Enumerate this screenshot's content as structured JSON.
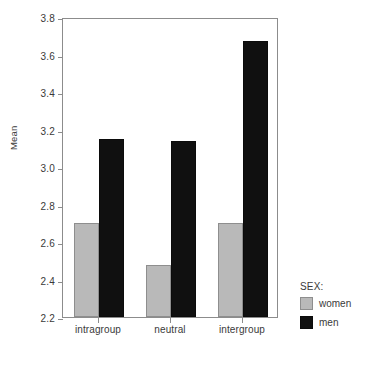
{
  "chart_data": {
    "type": "bar",
    "title": "",
    "xlabel": "",
    "ylabel": "Mean",
    "categories": [
      "intragroup",
      "neutral",
      "intergroup"
    ],
    "series": [
      {
        "name": "women",
        "values": [
          2.7,
          2.48,
          2.7
        ],
        "color": "#b9b9b9"
      },
      {
        "name": "men",
        "values": [
          3.15,
          3.14,
          3.67
        ],
        "color": "#101010"
      }
    ],
    "ylim": [
      2.2,
      3.8
    ],
    "ytick_step": 0.2,
    "yticks": [
      "2.2",
      "2.4",
      "2.6",
      "2.8",
      "3.0",
      "3.2",
      "3.4",
      "3.6",
      "3.8"
    ],
    "grid": false,
    "legend": {
      "title": "SEX:",
      "position": "right-bottom",
      "entries": [
        {
          "label": "women",
          "color": "#b9b9b9"
        },
        {
          "label": "men",
          "color": "#101010"
        }
      ]
    }
  }
}
